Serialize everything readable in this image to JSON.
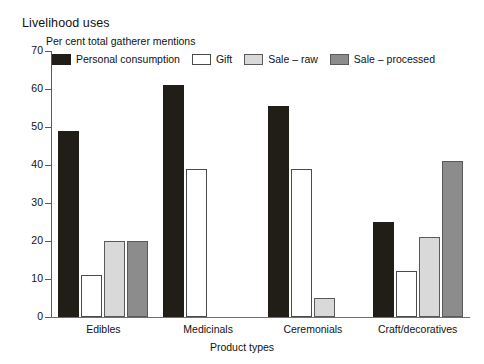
{
  "chart_data": {
    "type": "bar",
    "title": "Livelihood uses",
    "ylabel": "Per cent total gatherer mentions",
    "xlabel": "Product types",
    "ylim": [
      0,
      70
    ],
    "yticks": [
      0,
      10,
      20,
      30,
      40,
      50,
      60,
      70
    ],
    "grid": false,
    "legend_position": "top-inside",
    "categories": [
      "Edibles",
      "Medicinals",
      "Ceremonials",
      "Craft/decoratives"
    ],
    "series": [
      {
        "name": "Personal consumption",
        "color": "#211d17",
        "values": [
          49,
          61,
          55.5,
          25
        ]
      },
      {
        "name": "Gift",
        "color": "#ffffff",
        "values": [
          11,
          39,
          39,
          12
        ]
      },
      {
        "name": "Sale – raw",
        "color": "#d9d9d9",
        "values": [
          20,
          0,
          5,
          21
        ]
      },
      {
        "name": "Sale – processed",
        "color": "#8c8c8c",
        "values": [
          20,
          0,
          0,
          41
        ]
      }
    ]
  }
}
